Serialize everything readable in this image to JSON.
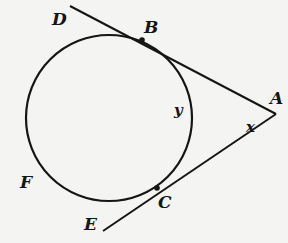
{
  "diagram": {
    "type": "geometry",
    "colors": {
      "stroke": "#151515",
      "background": "#f4f4f2"
    },
    "circle": {
      "cx": 109,
      "cy": 118,
      "r": 83
    },
    "points": {
      "A": {
        "label": "A",
        "x": 276,
        "y": 114
      },
      "B": {
        "label": "B",
        "x": 142,
        "y": 40
      },
      "C": {
        "label": "C",
        "x": 157,
        "y": 188
      },
      "D": {
        "label": "D",
        "x": 70,
        "y": 6
      },
      "E": {
        "label": "E",
        "x": 103,
        "y": 231
      },
      "F": {
        "label": "F"
      }
    },
    "variables": {
      "x": {
        "label": "x",
        "meaning": "angle at A"
      },
      "y": {
        "label": "y",
        "meaning": "minor arc BC"
      }
    },
    "segments": [
      "DA (through B)",
      "EA (through C)"
    ]
  }
}
